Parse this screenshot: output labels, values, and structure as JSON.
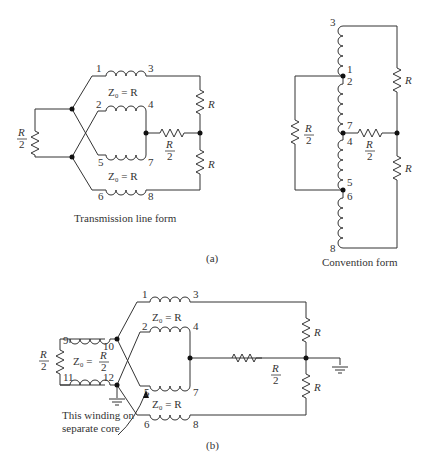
{
  "figure": {
    "panel_a": {
      "label": "(a)",
      "transmission_line_form": {
        "caption": "Transmission line form",
        "terminals": [
          "1",
          "3",
          "2",
          "4",
          "5",
          "7",
          "6",
          "8"
        ],
        "z0_top": "Z₀ = R",
        "z0_bottom": "Z₀ = R",
        "load_top": "R",
        "load_bottom": "R",
        "mid_resistor_num": "R",
        "mid_resistor_den": "2",
        "source_num": "R",
        "source_den": "2"
      },
      "convention_form": {
        "caption": "Convention form",
        "terminals": [
          "3",
          "1",
          "2",
          "7",
          "4",
          "5",
          "6",
          "8"
        ],
        "load_top": "R",
        "load_bottom": "R",
        "mid_resistor_num": "R",
        "mid_resistor_den": "2",
        "source_num": "R",
        "source_den": "2"
      }
    },
    "panel_b": {
      "label": "(b)",
      "terminals": [
        "1",
        "3",
        "2",
        "4",
        "5",
        "7",
        "6",
        "8",
        "9",
        "10",
        "11",
        "12"
      ],
      "z0_top": "Z₀ = R",
      "z0_bottom": "Z₀ = R",
      "z0_balun_prefix": "Z₀ =",
      "z0_balun_num": "R",
      "z0_balun_den": "2",
      "load_top": "R",
      "load_bottom": "R",
      "mid_resistor_num": "R",
      "mid_resistor_den": "2",
      "source_num": "R",
      "source_den": "2",
      "annotation_line1": "This winding on",
      "annotation_line2": "separate core"
    }
  }
}
